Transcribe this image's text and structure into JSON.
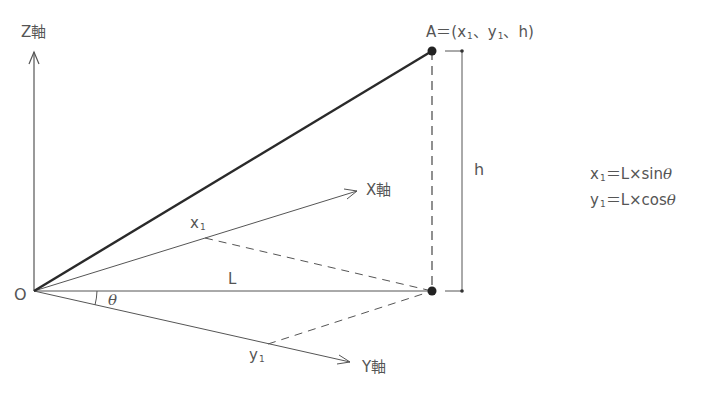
{
  "labels": {
    "z_axis": "Z軸",
    "x_axis": "X軸",
    "y_axis": "Y軸",
    "origin": "O",
    "point_a_prefix": "A＝(",
    "point_a_x": "x",
    "point_a_x_sub": "1",
    "point_a_sep1": "、",
    "point_a_y": "y",
    "point_a_y_sub": "1",
    "point_a_sep2": "、",
    "point_a_h": "h",
    "point_a_suffix": ")",
    "height": "h",
    "length": "L",
    "angle": "θ",
    "x1": "x",
    "x1_sub": "1",
    "y1": "y",
    "y1_sub": "1"
  },
  "formulas": [
    {
      "var": "x",
      "sub": "1",
      "expr": "＝L×sin",
      "angle": "θ"
    },
    {
      "var": "y",
      "sub": "1",
      "expr": "＝L×cos",
      "angle": "θ"
    }
  ],
  "colors": {
    "line": "#555555",
    "bold_line": "#2a2a2a",
    "text": "#555555"
  }
}
